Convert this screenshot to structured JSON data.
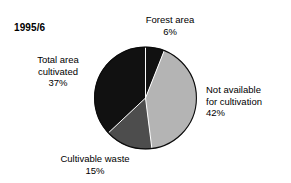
{
  "figure": {
    "period_label": "1995/6"
  },
  "chart_data": {
    "type": "pie",
    "title": "1995/6",
    "xlabel": "",
    "ylabel": "",
    "legend_position": "none",
    "grid": false,
    "unit": "%",
    "start_angle_deg": 0,
    "direction": "clockwise",
    "categories": [
      "Forest area",
      "Not available for cultivation",
      "Cultivable waste",
      "Total area cultivated"
    ],
    "values": [
      6,
      42,
      15,
      37
    ],
    "colors": [
      "#111111",
      "#b4b4b4",
      "#4d4d4d",
      "#111111"
    ],
    "slices": [
      {
        "name": "Forest area",
        "label": "Forest area",
        "value": 6,
        "value_text": "6%",
        "color": "#111111",
        "start_deg": 0,
        "end_deg": 21.6
      },
      {
        "name": "Not available for cultivation",
        "label_line1": "Not available",
        "label_line2": "for cultivation",
        "value": 42,
        "value_text": "42%",
        "color": "#b4b4b4",
        "start_deg": 21.6,
        "end_deg": 172.8
      },
      {
        "name": "Cultivable waste",
        "label": "Cultivable waste",
        "value": 15,
        "value_text": "15%",
        "color": "#4d4d4d",
        "start_deg": 172.8,
        "end_deg": 226.8
      },
      {
        "name": "Total area cultivated",
        "label_line1": "Total area",
        "label_line2": "cultivated",
        "value": 37,
        "value_text": "37%",
        "color": "#111111",
        "start_deg": 226.8,
        "end_deg": 360
      }
    ]
  },
  "labels": {
    "forest": {
      "line1": "Forest area",
      "pct": "6%"
    },
    "not_available": {
      "line1": "Not available",
      "line2": "for cultivation",
      "pct": "42%"
    },
    "cultivated": {
      "line1": "Total area",
      "line2": "cultivated",
      "pct": "37%"
    },
    "waste": {
      "line1": "Cultivable waste",
      "pct": "15%"
    }
  }
}
